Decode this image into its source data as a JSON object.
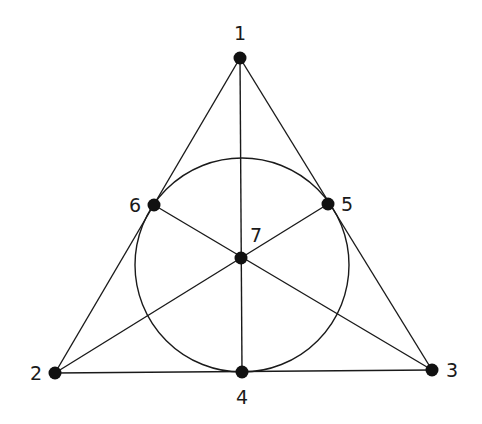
{
  "diagram": {
    "points": [
      {
        "id": "1",
        "label": "1",
        "x": 240,
        "y": 58,
        "lx": 240,
        "ly": 40,
        "anchor": "middle"
      },
      {
        "id": "2",
        "label": "2",
        "x": 55,
        "y": 373,
        "lx": 36,
        "ly": 380,
        "anchor": "middle"
      },
      {
        "id": "3",
        "label": "3",
        "x": 432,
        "y": 370,
        "lx": 452,
        "ly": 377,
        "anchor": "middle"
      },
      {
        "id": "4",
        "label": "4",
        "x": 242,
        "y": 372,
        "lx": 242,
        "ly": 404,
        "anchor": "middle"
      },
      {
        "id": "5",
        "label": "5",
        "x": 328,
        "y": 204,
        "lx": 347,
        "ly": 211,
        "anchor": "middle"
      },
      {
        "id": "6",
        "label": "6",
        "x": 154,
        "y": 205,
        "lx": 135,
        "ly": 212,
        "anchor": "middle"
      },
      {
        "id": "7",
        "label": "7",
        "x": 241,
        "y": 258,
        "lx": 256,
        "ly": 242,
        "anchor": "middle"
      }
    ],
    "lines": [
      [
        "1",
        "2"
      ],
      [
        "1",
        "3"
      ],
      [
        "2",
        "3"
      ],
      [
        "1",
        "4"
      ],
      [
        "2",
        "5"
      ],
      [
        "3",
        "6"
      ]
    ],
    "circle": {
      "cx": 242,
      "cy": 265,
      "r": 107
    },
    "colors": {
      "stroke": "#1a1a1a",
      "point": "#111111",
      "background": "#ffffff"
    }
  }
}
